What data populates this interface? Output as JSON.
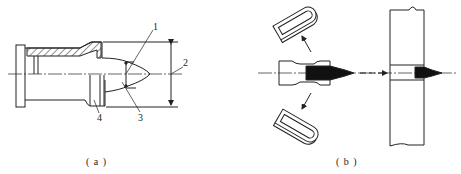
{
  "figure": {
    "panel_a": {
      "caption": "( a )",
      "callouts": {
        "c1": "1",
        "c2": "2",
        "c3": "3",
        "c4": "4"
      }
    },
    "panel_b": {
      "caption": "( b )"
    }
  },
  "colors": {
    "line": "#222222",
    "fill_dark": "#111111",
    "background": "#ffffff"
  }
}
